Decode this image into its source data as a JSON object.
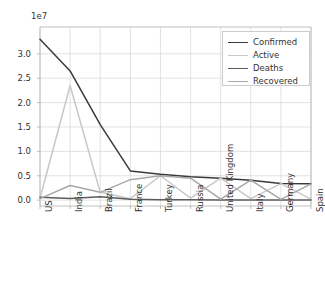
{
  "chart_data": {
    "type": "line",
    "title": "",
    "xlabel": "",
    "ylabel": "",
    "y_offset_text": "1e7",
    "grid": true,
    "legend_position": "upper right",
    "ylim": [
      -1200000.0,
      35500000.0
    ],
    "yticks": [
      0,
      5000000,
      10000000,
      15000000,
      20000000,
      25000000,
      30000000
    ],
    "ytick_labels": [
      "0.0",
      "0.5",
      "1.0",
      "1.5",
      "2.0",
      "2.5",
      "3.0"
    ],
    "categories": [
      "US",
      "India",
      "Brazil",
      "France",
      "Turkey",
      "Russia",
      "United Kingdom",
      "Italy",
      "Germany",
      "Spain"
    ],
    "series": [
      {
        "name": "Confirmed",
        "color": "#3a3a3a",
        "values": [
          33000000,
          26500000,
          15500000,
          6000000,
          5300000,
          4800000,
          4500000,
          4100000,
          3400000,
          3350000
        ]
      },
      {
        "name": "Active",
        "color": "#c8c8c8",
        "values": [
          400000,
          23500000,
          1600000,
          300000,
          5000000,
          400000,
          4500000,
          300000,
          3400000,
          200000
        ]
      },
      {
        "name": "Deaths",
        "color": "#5c5c5c",
        "values": [
          600000,
          350000,
          700000,
          200000,
          100000,
          60000,
          40000,
          30000,
          20000,
          20000
        ]
      },
      {
        "name": "Recovered",
        "color": "#a8a8a8",
        "values": [
          300000,
          3000000,
          1600000,
          4200000,
          5000000,
          4500000,
          200000,
          4100000,
          150000,
          3350000
        ]
      }
    ]
  },
  "legend": {
    "entries": [
      {
        "label": "Confirmed"
      },
      {
        "label": "Active"
      },
      {
        "label": "Deaths"
      },
      {
        "label": "Recovered"
      }
    ]
  },
  "axes": {
    "plot_left": 40,
    "plot_right": 311,
    "plot_top": 27,
    "plot_bottom": 206
  }
}
